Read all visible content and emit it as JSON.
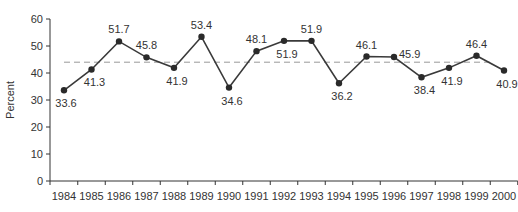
{
  "chart_data": {
    "type": "line",
    "title": "",
    "xlabel": "",
    "ylabel": "Percent",
    "ylim": [
      0,
      60
    ],
    "yticks": [
      0,
      10,
      20,
      30,
      40,
      50,
      60
    ],
    "grid": false,
    "legend": null,
    "categories": [
      "1984",
      "1985",
      "1986",
      "1987",
      "1988",
      "1989",
      "1990",
      "1991",
      "1992",
      "1993",
      "1994",
      "1995",
      "1996",
      "1997",
      "1998",
      "1999",
      "2000"
    ],
    "series": [
      {
        "name": "Percent",
        "values": [
          33.6,
          41.3,
          51.7,
          45.8,
          41.9,
          53.4,
          34.6,
          48.1,
          51.9,
          51.9,
          36.2,
          46.1,
          45.9,
          38.4,
          41.9,
          46.4,
          40.9
        ],
        "labels": [
          "33.6",
          "41.3",
          "51.7",
          "45.8",
          "41.9",
          "53.4",
          "34.6",
          "48.1",
          "51.9",
          "51.9",
          "36.2",
          "46.1",
          "45.9",
          "38.4",
          "41.9",
          "46.4",
          "40.9"
        ],
        "label_positions": [
          "below",
          "below",
          "above",
          "above",
          "below",
          "above",
          "below",
          "above",
          "below",
          "above",
          "below",
          "above",
          "right",
          "below",
          "below",
          "above",
          "below"
        ]
      }
    ],
    "reference_line": {
      "style": "dashed",
      "value": 44.0,
      "color": "#999999"
    },
    "colors": {
      "line": "#3a3a3a",
      "marker": "#2a2a2a",
      "axis": "#333333",
      "text": "#333333"
    }
  }
}
